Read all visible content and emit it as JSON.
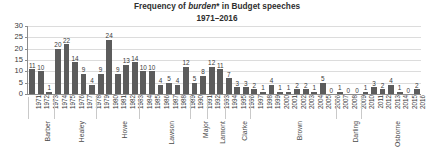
{
  "chart_data": {
    "type": "bar",
    "title": "Frequency of burden* in Budget speeches",
    "title_plain_prefix": "Frequency of ",
    "title_emphasis": "burden",
    "title_plain_suffix": "* in Budget speeches",
    "subtitle": "1971–2016",
    "xlabel": "",
    "ylabel": "",
    "ylim": [
      0,
      30
    ],
    "grid": true,
    "legend": "none",
    "yticks": [
      0,
      5,
      10,
      15,
      20,
      25,
      30
    ],
    "bar_color": "#5c5c5c",
    "gridline_color": "#dcdcdc",
    "axis_color": "#8c8c8c",
    "categories": [
      "1971",
      "1972",
      "1973",
      "1974",
      "1975",
      "1976",
      "1977",
      "1978",
      "1979",
      "1980",
      "1981",
      "1982",
      "1983",
      "1984",
      "1985",
      "1986",
      "1987",
      "1988",
      "1989",
      "1990",
      "1991",
      "1992",
      "1993",
      "1994",
      "1995",
      "1996",
      "1997",
      "1998",
      "1999",
      "2000",
      "2001",
      "2002",
      "2003",
      "2004",
      "2005",
      "2006",
      "2007",
      "2008",
      "2009",
      "2010",
      "2011",
      "2012",
      "2013",
      "2014",
      "2015",
      "2016"
    ],
    "values": [
      11,
      10,
      1,
      20,
      22,
      14,
      9,
      4,
      9,
      24,
      9,
      13,
      14,
      10,
      10,
      4,
      5,
      4,
      12,
      5,
      8,
      12,
      11,
      7,
      3,
      3,
      2,
      1,
      4,
      1,
      1,
      2,
      2,
      1,
      5,
      0,
      1,
      0,
      0,
      1,
      3,
      2,
      4,
      1,
      0,
      2
    ],
    "data_labels": [
      "11",
      "10",
      "1",
      "20",
      "22",
      "14",
      "9",
      "4",
      "9",
      "24",
      "9",
      "13",
      "14",
      "10",
      "10",
      "4",
      "5",
      "4",
      "12",
      "5",
      "8",
      "12",
      "11",
      "7",
      "3",
      "3",
      "2",
      "1",
      "4",
      "1",
      "1",
      "2",
      "2",
      "1",
      "5",
      "0",
      "1",
      "0",
      "0",
      "1",
      "3",
      "2",
      "4",
      "1",
      "0",
      "2"
    ],
    "groups": [
      {
        "label": "Barber",
        "start_index": 0,
        "end_index": 2
      },
      {
        "label": "Healey",
        "start_index": 3,
        "end_index": 7
      },
      {
        "label": "Howe",
        "start_index": 8,
        "end_index": 12
      },
      {
        "label": "Lawson",
        "start_index": 13,
        "end_index": 18
      },
      {
        "label": "Major",
        "start_index": 19,
        "end_index": 20
      },
      {
        "label": "Lamont",
        "start_index": 21,
        "end_index": 22
      },
      {
        "label": "Clarke",
        "start_index": 23,
        "end_index": 25
      },
      {
        "label": "Brown",
        "start_index": 26,
        "end_index": 35
      },
      {
        "label": "Darling",
        "start_index": 36,
        "end_index": 38
      },
      {
        "label": "Osborne",
        "start_index": 39,
        "end_index": 45
      }
    ]
  }
}
